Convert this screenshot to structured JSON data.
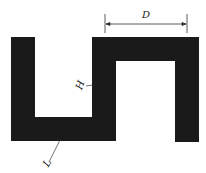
{
  "diagram": {
    "type": "meander-trace",
    "shape_color": "#1a1a1a",
    "line_color": "#333333",
    "labels": {
      "D": "D",
      "H": "H",
      "L": "L"
    },
    "annotations": [
      {
        "label": "D",
        "meaning": "dimension line spanning the top bar width"
      },
      {
        "label": "H",
        "meaning": "leader pointing to inner vertical segment"
      },
      {
        "label": "L",
        "meaning": "leader pointing to bottom horizontal segment"
      }
    ]
  }
}
